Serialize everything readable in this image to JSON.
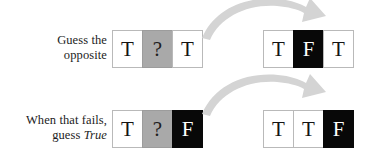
{
  "figure": {
    "background_color": "#ffffff",
    "arrow_color": "#d4d4d4",
    "cell_colors": {
      "white": "#ffffff",
      "gray": "#a9a9a9",
      "black": "#080808"
    }
  },
  "rows": [
    {
      "caption": {
        "line1": "Guess the",
        "line2": "opposite",
        "line2_italic": false
      },
      "before": {
        "cells": [
          {
            "text": "T",
            "fill": "white"
          },
          {
            "text": "?",
            "fill": "gray"
          },
          {
            "text": "T",
            "fill": "white"
          }
        ]
      },
      "after": {
        "cells": [
          {
            "text": "T",
            "fill": "white"
          },
          {
            "text": "F",
            "fill": "black"
          },
          {
            "text": "T",
            "fill": "white"
          }
        ]
      },
      "arrow": {
        "name": "transition-arrow-1",
        "direction": "left-to-right-curved"
      }
    },
    {
      "caption": {
        "line1": "When that fails,",
        "line2_prefix": "guess ",
        "line2_emphasis": "True",
        "line2_italic": true
      },
      "before": {
        "cells": [
          {
            "text": "T",
            "fill": "white"
          },
          {
            "text": "?",
            "fill": "gray"
          },
          {
            "text": "F",
            "fill": "black"
          }
        ]
      },
      "after": {
        "cells": [
          {
            "text": "T",
            "fill": "white"
          },
          {
            "text": "T",
            "fill": "white"
          },
          {
            "text": "F",
            "fill": "black"
          }
        ]
      },
      "arrow": {
        "name": "transition-arrow-2",
        "direction": "left-to-right-curved"
      }
    }
  ]
}
